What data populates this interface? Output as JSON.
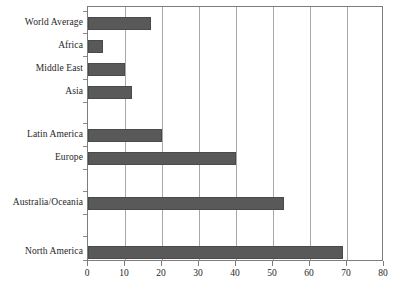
{
  "chart_data": {
    "type": "bar",
    "orientation": "horizontal",
    "title": "",
    "subtitle": "",
    "xlabel": "",
    "ylabel": "",
    "xlim": [
      0,
      80
    ],
    "xticks": [
      0,
      10,
      20,
      30,
      40,
      50,
      60,
      70,
      80
    ],
    "grid": true,
    "grid_axis": "x",
    "legend": false,
    "legend_position": "none",
    "bar_color": "#595959",
    "categories": [
      "World Average",
      "Africa",
      "Middle East",
      "Asia",
      "Latin America",
      "Europe",
      "Australia/Oceania",
      "North America"
    ],
    "values": [
      17,
      4,
      10,
      12,
      20,
      40,
      53,
      69
    ],
    "series": [
      {
        "name": "",
        "values": [
          17,
          4,
          10,
          12,
          20,
          40,
          53,
          69
        ]
      }
    ]
  },
  "axis": {
    "x_tick_labels": [
      "0",
      "10",
      "20",
      "30",
      "40",
      "50",
      "60",
      "70",
      "80"
    ]
  },
  "rows": [
    {
      "label": "World Average",
      "value": 17
    },
    {
      "label": "Africa",
      "value": 4
    },
    {
      "label": "Middle East",
      "value": 10
    },
    {
      "label": "Asia",
      "value": 12
    },
    {
      "label": "Latin America",
      "value": 20
    },
    {
      "label": "Europe",
      "value": 40
    },
    {
      "label": "Australia/Oceania",
      "value": 53
    },
    {
      "label": "North America",
      "value": 69
    }
  ]
}
